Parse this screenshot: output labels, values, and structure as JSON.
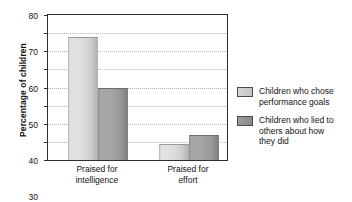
{
  "chart_data": {
    "type": "bar",
    "title": "",
    "xlabel": "",
    "ylabel": "Percentage of children",
    "ylim": [
      0,
      80
    ],
    "yticks": [
      0,
      10,
      20,
      30,
      40,
      50,
      60,
      70,
      80
    ],
    "grid": true,
    "legend_position": "right",
    "categories": [
      "Praised for intelligence",
      "Praised for effort"
    ],
    "category_lines": [
      [
        "Praised for",
        "intelligence"
      ],
      [
        "Praised for",
        "effort"
      ]
    ],
    "series": [
      {
        "name": "Children who chose performance goals",
        "name_lines": [
          "Children who chose",
          "performance goals"
        ],
        "color": "#d2d2d2",
        "values": [
          68,
          9
        ]
      },
      {
        "name": "Children who lied to others about how they did",
        "name_lines": [
          "Children who lied to",
          "others about how",
          "they did"
        ],
        "color": "#9a9a9a",
        "values": [
          40,
          14
        ]
      }
    ]
  },
  "axis": {
    "y_title": "Percentage of children"
  }
}
